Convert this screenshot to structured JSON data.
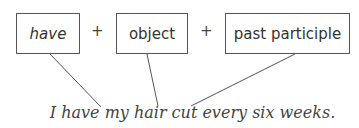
{
  "diagram": {
    "boxes": [
      {
        "label": "have",
        "italic": true
      },
      {
        "label": "object",
        "italic": false
      },
      {
        "label": "past participle",
        "italic": false
      }
    ],
    "operators": [
      "+",
      "+"
    ],
    "sentence": "I have my hair cut every six weeks.",
    "colors": {
      "box_border": "#555555",
      "line": "#555555",
      "text": "#333333"
    }
  }
}
